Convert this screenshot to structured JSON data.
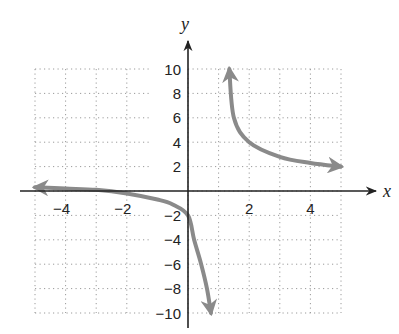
{
  "chart_data": {
    "type": "line",
    "title": "",
    "xlabel": "x",
    "ylabel": "y",
    "xlim": [
      -5,
      5
    ],
    "ylim": [
      -10,
      10
    ],
    "grid": true,
    "grid_style": "dotted",
    "x_ticks": [
      -4,
      -2,
      2,
      4
    ],
    "x_tick_labels": [
      "−4",
      "−2",
      "2",
      "4"
    ],
    "y_ticks": [
      10,
      8,
      6,
      4,
      2,
      -2,
      -4,
      -6,
      -8,
      -10
    ],
    "y_tick_labels": [
      "10",
      "8",
      "6",
      "4",
      "2",
      "−2",
      "−4",
      "−6",
      "−8",
      "−10"
    ],
    "curve_color": "#8a8a8a",
    "axis_color": "#222222",
    "series": [
      {
        "name": "left branch",
        "arrows": "both",
        "x": [
          -5,
          -4,
          -3,
          -2,
          -1,
          -0.5,
          0,
          0.2,
          0.43,
          0.62,
          0.75
        ],
        "y": [
          0.3,
          0.2,
          0.1,
          -0.2,
          -0.7,
          -1.1,
          -2,
          -4,
          -6,
          -8,
          -10
        ]
      },
      {
        "name": "right branch",
        "arrows": "both",
        "x": [
          1.35,
          1.5,
          2,
          3,
          4,
          5
        ],
        "y": [
          10,
          6,
          4,
          2.8,
          2.3,
          2.0
        ]
      }
    ]
  }
}
